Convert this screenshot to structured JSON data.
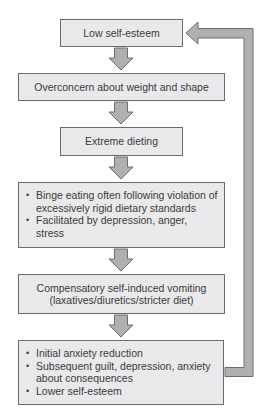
{
  "diagram": {
    "type": "flowchart",
    "nodes": [
      {
        "id": "n1",
        "text": "Low self-esteem"
      },
      {
        "id": "n2",
        "text": "Overconcern about weight and shape"
      },
      {
        "id": "n3",
        "text": "Extreme dieting"
      },
      {
        "id": "n4",
        "bullets": [
          "Binge eating often following violation of excessively rigid dietary standards",
          "Facilitated by depression, anger, stress"
        ]
      },
      {
        "id": "n5",
        "lines": [
          "Compensatory self-induced vomiting",
          "(laxatives/diuretics/stricter diet)"
        ]
      },
      {
        "id": "n6",
        "bullets": [
          "Initial anxiety reduction",
          "Subsequent guilt, depression, anxiety about consequences",
          "Lower self-esteem"
        ]
      }
    ],
    "edges": [
      {
        "from": "n1",
        "to": "n2"
      },
      {
        "from": "n2",
        "to": "n3"
      },
      {
        "from": "n3",
        "to": "n4"
      },
      {
        "from": "n4",
        "to": "n5"
      },
      {
        "from": "n5",
        "to": "n6"
      },
      {
        "from": "n6",
        "to": "n1",
        "kind": "feedback-loop"
      }
    ],
    "colors": {
      "box_fill": "#e9e9eb",
      "box_border": "#6b6b6b",
      "arrow_fill": "#b0b0b2",
      "arrow_stroke": "#6e6e6e",
      "text": "#3a3a3a"
    }
  }
}
